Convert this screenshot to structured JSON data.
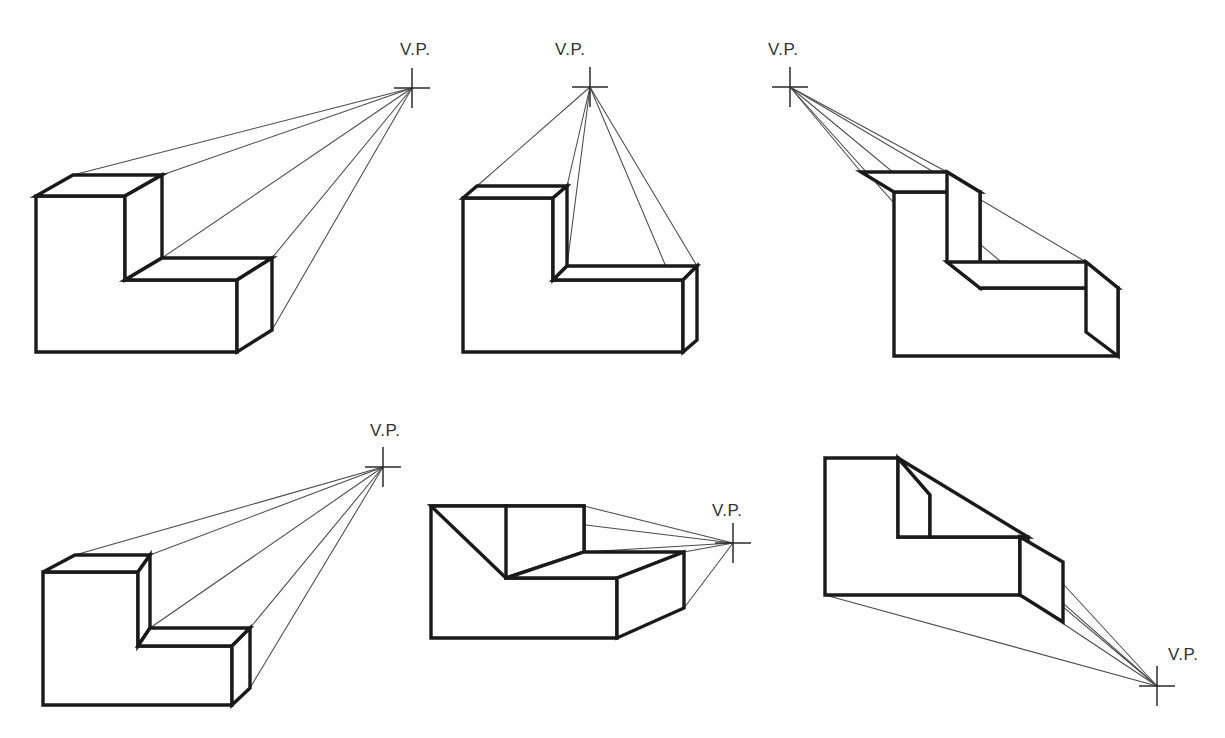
{
  "sheet": {
    "title": "One-Point Perspective Drawings of an L-Block",
    "width": 1225,
    "height": 738,
    "background_color": "#fefefe",
    "edge_color": "#1a1a1a",
    "ray_color": "#4a4a4a",
    "label_color": "#333333"
  },
  "labels": {
    "vanishing_point": "V.P."
  },
  "figures": [
    {
      "id": "figure-1",
      "position": "top-left",
      "vp_label": "V.P.",
      "vp": {
        "x": 412,
        "y": 88
      },
      "vp_label_pos": {
        "x": 400,
        "y": 55
      },
      "vp_label_anchor": "start",
      "description": "L-shaped block, vanishing point far upper-right, four receding rays",
      "front_face": "M 36,196 L 36,352 L 237,352 L 237,280 L 125,280 L 125,196 Z",
      "top_small": "M 36,196 L 73,175 L 162,175 L 125,196 Z",
      "top_riser": "M 125,196 L 162,175 L 162,258 L 125,280 Z",
      "top_long": "M 125,280 L 162,258 L 272,258 L 237,280 Z",
      "side_right": "M 237,280 L 272,258 L 272,330 L 237,352 Z",
      "rays": [
        {
          "from": {
            "x": 73,
            "y": 175
          },
          "to": {
            "x": 412,
            "y": 88
          }
        },
        {
          "from": {
            "x": 162,
            "y": 175
          },
          "to": {
            "x": 412,
            "y": 88
          }
        },
        {
          "from": {
            "x": 162,
            "y": 258
          },
          "to": {
            "x": 412,
            "y": 88
          }
        },
        {
          "from": {
            "x": 272,
            "y": 258
          },
          "to": {
            "x": 412,
            "y": 88
          }
        },
        {
          "from": {
            "x": 272,
            "y": 330
          },
          "to": {
            "x": 412,
            "y": 88
          }
        }
      ]
    },
    {
      "id": "figure-2",
      "position": "top-center",
      "vp_label": "V.P.",
      "vp": {
        "x": 590,
        "y": 87
      },
      "vp_label_pos": {
        "x": 555,
        "y": 55
      },
      "vp_label_anchor": "start",
      "description": "L-shaped block seen from below, vanishing point directly above",
      "front_face": "M 463,198 L 463,352 L 683,352 L 683,280 L 553,280 L 553,198 Z",
      "top_small": "M 463,198 L 477,186 L 567,186 L 553,198 Z",
      "top_riser": "M 553,198 L 567,186 L 567,266 L 553,280 Z",
      "top_long": "M 553,280 L 567,266 L 697,266 L 683,280 Z",
      "side_right": "M 683,280 L 697,266 L 697,340 L 683,352 Z",
      "rays": [
        {
          "from": {
            "x": 477,
            "y": 186
          },
          "to": {
            "x": 590,
            "y": 87
          }
        },
        {
          "from": {
            "x": 567,
            "y": 186
          },
          "to": {
            "x": 590,
            "y": 87
          }
        },
        {
          "from": {
            "x": 567,
            "y": 266
          },
          "to": {
            "x": 590,
            "y": 87
          }
        },
        {
          "from": {
            "x": 697,
            "y": 266
          },
          "to": {
            "x": 590,
            "y": 87
          }
        },
        {
          "from": {
            "x": 697,
            "y": 340
          },
          "to": {
            "x": 590,
            "y": 87
          }
        }
      ]
    },
    {
      "id": "figure-3",
      "position": "top-right",
      "vp_label": "V.P.",
      "vp": {
        "x": 790,
        "y": 87
      },
      "vp_label_pos": {
        "x": 768,
        "y": 55
      },
      "vp_label_anchor": "start",
      "description": "L-shaped block, vanishing point upper-left, mirrored recession",
      "front_face": "M 894,192 L 894,356 L 1118,356 L 1118,288 L 980,288 L 980,192 Z",
      "top_small": "M 894,192 L 861,172 L 947,172 L 980,192 Z",
      "top_riser": "M 980,192 L 947,172 L 947,262 L 980,288 Z",
      "top_long": "M 980,288 L 947,262 L 1086,262 L 1118,288 Z",
      "side_right": "M 1118,288 L 1086,262 L 1086,332 L 1118,356 Z",
      "rays": [
        {
          "from": {
            "x": 861,
            "y": 172
          },
          "to": {
            "x": 790,
            "y": 87
          }
        },
        {
          "from": {
            "x": 947,
            "y": 172
          },
          "to": {
            "x": 790,
            "y": 87
          }
        },
        {
          "from": {
            "x": 947,
            "y": 262
          },
          "to": {
            "x": 790,
            "y": 87
          }
        },
        {
          "from": {
            "x": 1086,
            "y": 262
          },
          "to": {
            "x": 790,
            "y": 87
          }
        },
        {
          "from": {
            "x": 1086,
            "y": 332
          },
          "to": {
            "x": 790,
            "y": 87
          }
        }
      ]
    },
    {
      "id": "figure-4",
      "position": "bottom-left",
      "vp_label": "V.P.",
      "vp": {
        "x": 383,
        "y": 467
      },
      "vp_label_pos": {
        "x": 370,
        "y": 436
      },
      "vp_label_anchor": "start",
      "description": "L-shaped block, vanishing point upper-right, second row variant",
      "front_face": "M 43,572 L 43,705 L 232,705 L 232,646 L 138,646 L 138,572 Z",
      "top_small": "M 43,572 L 75,555 L 150,555 L 138,572 Z",
      "top_riser": "M 138,572 L 150,555 L 150,628 L 138,646 Z",
      "top_long": "M 138,646 L 150,628 L 250,628 L 232,646 Z",
      "side_right": "M 232,646 L 250,628 L 250,688 L 232,705 Z",
      "rays": [
        {
          "from": {
            "x": 75,
            "y": 555
          },
          "to": {
            "x": 383,
            "y": 467
          }
        },
        {
          "from": {
            "x": 150,
            "y": 555
          },
          "to": {
            "x": 383,
            "y": 467
          }
        },
        {
          "from": {
            "x": 150,
            "y": 628
          },
          "to": {
            "x": 383,
            "y": 467
          }
        },
        {
          "from": {
            "x": 250,
            "y": 628
          },
          "to": {
            "x": 383,
            "y": 467
          }
        },
        {
          "from": {
            "x": 250,
            "y": 688
          },
          "to": {
            "x": 383,
            "y": 467
          }
        }
      ]
    },
    {
      "id": "figure-5",
      "position": "bottom-center",
      "vp_label": "V.P.",
      "vp": {
        "x": 733,
        "y": 543
      },
      "vp_label_pos": {
        "x": 712,
        "y": 516
      },
      "vp_label_anchor": "start",
      "description": "L-shaped block with vanishing point to the right at mid height",
      "front_face": "M 431,506 L 431,638 L 617,638 L 617,578 L 506,578 L 506,506 Z",
      "top_small": "M 431,506 L 584,506 L 584,552 L 506,578 Z",
      "top_riser": "M 506,506 L 584,506 L 584,552 L 506,578 Z",
      "top_long": "M 506,578 L 584,552 L 684,552 L 617,578 Z",
      "side_right": "M 617,578 L 684,552 L 684,608 L 617,638 Z",
      "rays": [
        {
          "from": {
            "x": 431,
            "y": 506
          },
          "to": {
            "x": 733,
            "y": 543
          }
        },
        {
          "from": {
            "x": 584,
            "y": 506
          },
          "to": {
            "x": 733,
            "y": 543
          }
        },
        {
          "from": {
            "x": 584,
            "y": 552
          },
          "to": {
            "x": 733,
            "y": 543
          }
        },
        {
          "from": {
            "x": 684,
            "y": 552
          },
          "to": {
            "x": 733,
            "y": 543
          }
        },
        {
          "from": {
            "x": 684,
            "y": 608
          },
          "to": {
            "x": 733,
            "y": 543
          }
        }
      ]
    },
    {
      "id": "figure-6",
      "position": "bottom-right",
      "vp_label": "V.P.",
      "vp": {
        "x": 1157,
        "y": 686
      },
      "vp_label_pos": {
        "x": 1168,
        "y": 660
      },
      "vp_label_anchor": "start",
      "description": "L-shaped block above the horizon, vanishing point at lower right",
      "front_face": "M 825,458 L 825,595 L 1020,595 L 1020,537 L 898,537 L 898,458 Z",
      "top_small": "M 898,458 L 930,495 L 930,537 L 898,537 Z",
      "top_riser": "M 898,458 L 1028,537 L 930,537 L 930,495 Z",
      "top_long": "M 1020,537 L 1028,537 L 1028,595 L 1020,595 Z",
      "side_right": "M 1020,537 L 1063,562 L 1063,622 L 1020,595 Z",
      "rays": [
        {
          "from": {
            "x": 898,
            "y": 458
          },
          "to": {
            "x": 1157,
            "y": 686
          }
        },
        {
          "from": {
            "x": 930,
            "y": 495
          },
          "to": {
            "x": 1157,
            "y": 686
          }
        },
        {
          "from": {
            "x": 1020,
            "y": 537
          },
          "to": {
            "x": 1157,
            "y": 686
          }
        },
        {
          "from": {
            "x": 1020,
            "y": 595
          },
          "to": {
            "x": 1157,
            "y": 686
          }
        },
        {
          "from": {
            "x": 825,
            "y": 595
          },
          "to": {
            "x": 1157,
            "y": 686
          }
        }
      ]
    }
  ]
}
